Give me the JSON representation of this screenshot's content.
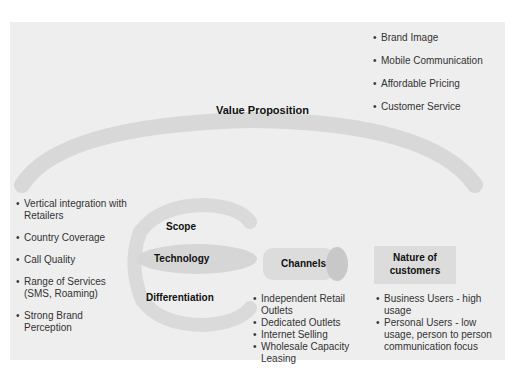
{
  "diagram": {
    "value_proposition": {
      "title": "Value Proposition",
      "items": [
        "Brand Image",
        "Mobile Communication",
        "Affordable Pricing",
        "Customer Service"
      ]
    },
    "left_factors": {
      "items": [
        "Vertical integration with Retailers",
        "Country Coverage",
        "Call Quality",
        "Range of Services (SMS, Roaming)",
        "Strong Brand Perception"
      ]
    },
    "ring": {
      "labels": [
        "Scope",
        "Technology",
        "Differentiation"
      ]
    },
    "channels": {
      "title": "Channels",
      "items": [
        "Independent Retail Outlets",
        "Dedicated Outlets",
        "Internet Selling",
        "Wholesale Capacity Leasing"
      ]
    },
    "customers": {
      "title": "Nature of customers",
      "items": [
        "Business Users - high usage",
        "Personal Users - low usage, person to person communication focus"
      ]
    },
    "colors": {
      "panel_bg": "#eeeeee",
      "shape_fill": "#d6d6d6",
      "text": "#222222"
    }
  }
}
